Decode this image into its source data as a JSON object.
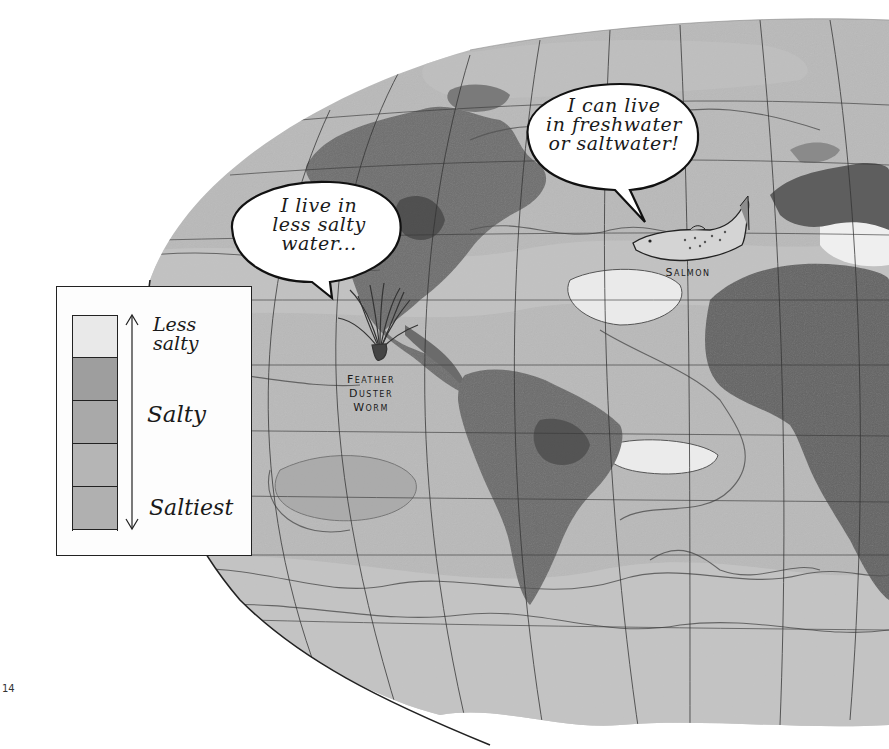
{
  "page": {
    "number": "14"
  },
  "bubbles": {
    "worm": {
      "lines": [
        "I live in",
        "less salty",
        "water..."
      ]
    },
    "salmon": {
      "lines": [
        "I can live",
        "in freshwater",
        "or saltwater!"
      ]
    }
  },
  "creatures": {
    "worm": {
      "lines": [
        "Feather",
        "Duster",
        "Worm"
      ]
    },
    "salmon": {
      "lines": [
        "Salmon"
      ]
    }
  },
  "legend": {
    "labels": {
      "top": [
        "Less",
        "salty"
      ],
      "middle": "Salty",
      "bottom": "Saltiest"
    },
    "swatches": [
      {
        "name": "less-salty",
        "color": "#e9e9e9"
      },
      {
        "name": "salty-1",
        "color": "#9e9e9e"
      },
      {
        "name": "salty-2",
        "color": "#a9a9a9"
      },
      {
        "name": "salty-3",
        "color": "#b5b5b5"
      },
      {
        "name": "saltiest",
        "color": "#b0b0b0"
      }
    ]
  },
  "colors": {
    "ocean": "#b9b9b9",
    "ocean_light": "#c8c8c8",
    "land": "#6e6e6e",
    "land_dark": "#585858",
    "fresh": "#ececec",
    "ink": "#2a2a2a",
    "paper": "#ffffff"
  }
}
